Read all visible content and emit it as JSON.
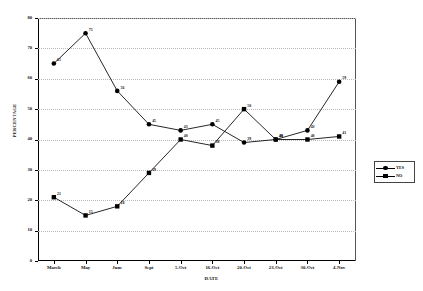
{
  "chart_data": {
    "type": "line",
    "title": "",
    "xlabel": "DATE",
    "ylabel": "PERCENTAGE",
    "categories": [
      "March",
      "May",
      "June",
      "Sept",
      "5-Oct",
      "16-Oct",
      "20-Oct",
      "23-Oct",
      "30-Oct",
      "4-Nov"
    ],
    "series": [
      {
        "name": "YES",
        "marker": "circle",
        "values": [
          65,
          75,
          56,
          45,
          43,
          45,
          39,
          40,
          43,
          59
        ]
      },
      {
        "name": "NO",
        "marker": "square",
        "values": [
          21,
          15,
          18,
          29,
          40,
          38,
          50,
          40,
          40,
          41
        ]
      }
    ],
    "ylim": [
      0,
      80
    ],
    "yticks": [
      0,
      10,
      20,
      30,
      40,
      50,
      60,
      70,
      80
    ],
    "grid": true,
    "legend_position": "right"
  },
  "legend": {
    "items": [
      {
        "label": "YES"
      },
      {
        "label": "NO"
      }
    ]
  },
  "colors": {
    "series_yes": "#000000",
    "series_no": "#000000",
    "gridline": "#b9b9b9",
    "axis": "#000000",
    "background": "#ffffff"
  }
}
